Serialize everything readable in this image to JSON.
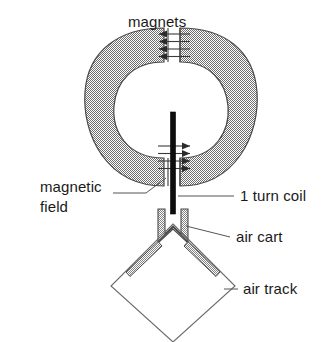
{
  "figure": {
    "title_label": "magnets",
    "labels": {
      "magnets": "magnets",
      "magnetic_field_line1": "magnetic",
      "magnetic_field_line2": "field",
      "one_turn_coil": "1 turn coil",
      "air_cart": "air cart",
      "air_track": "air track"
    },
    "colors": {
      "background": "#ffffff",
      "magnet_fill": "#b4b4b4",
      "magnet_stroke": "#4a4a4a",
      "cart_fill": "#c6c6c6",
      "cart_stroke": "#4a4a4a",
      "coil_wire": "#0d0d0d",
      "field_arrow": "#2b2b2b",
      "leader_line": "#555555",
      "text": "#1a1a1a",
      "track_stroke": "#6a6a6a"
    },
    "parts": {
      "magnet_yoke": "rounded-square toroidal magnet with central white aperture",
      "top_gap": "upper pole gap with magnetic field arrows pointing left",
      "bottom_gap": "lower pole gap with magnetic field arrows pointing right",
      "coil": "single vertical black 1 turn coil wire",
      "cart": "U-channel air cart with V skirts",
      "track": "diamond (rotated square) air track outline"
    },
    "field_arrows": {
      "top_direction": "left",
      "top_count": 4,
      "bottom_direction": "right",
      "bottom_count": 4
    }
  }
}
